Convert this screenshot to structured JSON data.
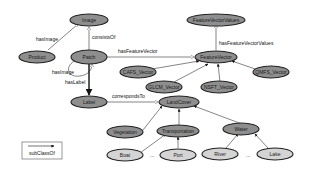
{
  "diagram": {
    "type": "ontology-graph",
    "nodes": {
      "image": {
        "label": "Image",
        "style": "dark"
      },
      "feature_vector_values": {
        "label": "FeatureVectorValues",
        "style": "dark"
      },
      "product": {
        "label": "Product",
        "style": "dark"
      },
      "patch": {
        "label": "Patch",
        "style": "dark"
      },
      "feature_vector": {
        "label": "FeatureVector",
        "style": "dark"
      },
      "cafs_vector": {
        "label": "CAFS_Vector",
        "style": "dark"
      },
      "glcm_vector": {
        "label": "GLCM_Vector",
        "style": "dark"
      },
      "nsft_vector": {
        "label": "NSFT_Vector",
        "style": "dark"
      },
      "qmfs_vector": {
        "label": "QMFS_Vector",
        "style": "dark"
      },
      "label": {
        "label": "Label",
        "style": "dark"
      },
      "land_cover": {
        "label": "LandCover",
        "style": "dark"
      },
      "vegetation": {
        "label": "Vegetation",
        "style": "dark"
      },
      "transportation": {
        "label": "Transportation",
        "style": "dark"
      },
      "water": {
        "label": "Water",
        "style": "dark"
      },
      "boat": {
        "label": "Boat",
        "style": "light"
      },
      "port": {
        "label": "Port",
        "style": "light"
      },
      "river": {
        "label": "River",
        "style": "light"
      },
      "lake": {
        "label": "Lake",
        "style": "light"
      }
    },
    "edges": {
      "has_image": "hasImage",
      "consists_of": "consistsOf",
      "has_feature_vector": "hasFeatureVector",
      "has_feature_vector_values": "hasFeatureVectorValues",
      "has_image_self": "hasImage",
      "has_label": "hasLabel",
      "corresponds_to": "correspondsTo"
    },
    "ellipses": {
      "transportation": "...",
      "water": "..."
    },
    "legend": {
      "label": "subClassOf"
    }
  }
}
